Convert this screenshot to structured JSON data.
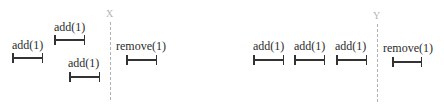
{
  "diagrams": [
    {
      "marker": "X",
      "ops": [
        {
          "label": "add(1)",
          "x": 12,
          "label_y": 39,
          "bar_y": 53,
          "w": 31
        },
        {
          "label": "add(1)",
          "x": 54,
          "label_y": 21,
          "bar_y": 35,
          "w": 31
        },
        {
          "label": "add(1)",
          "x": 69,
          "label_y": 57,
          "bar_y": 72,
          "w": 31
        },
        {
          "label": "remove(1)",
          "x": 126,
          "label_y": 40,
          "bar_y": 55,
          "w": 31
        }
      ]
    },
    {
      "marker": "Y",
      "ops": [
        {
          "label": "add(1)",
          "x": 253,
          "label_y": 40,
          "bar_y": 55,
          "w": 31
        },
        {
          "label": "add(1)",
          "x": 294,
          "label_y": 40,
          "bar_y": 55,
          "w": 31
        },
        {
          "label": "add(1)",
          "x": 336,
          "label_y": 40,
          "bar_y": 55,
          "w": 31
        },
        {
          "label": "remove(1)",
          "x": 392,
          "label_y": 42,
          "bar_y": 57,
          "w": 30
        }
      ]
    }
  ]
}
